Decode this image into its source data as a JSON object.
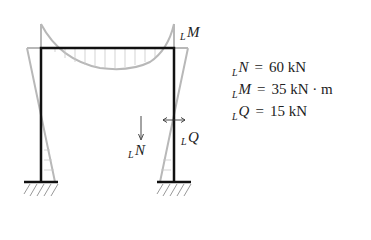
{
  "diagram": {
    "type": "portal frame bending moment diagram",
    "labels": {
      "moment": {
        "sub": "L",
        "var": "M"
      },
      "normal": {
        "sub": "L",
        "var": "N"
      },
      "shear": {
        "sub": "L",
        "var": "Q"
      }
    },
    "colors": {
      "frame": "#111111",
      "moment_diagram": "#b8b8b8",
      "hatch": "#999999",
      "arrows": "#333333"
    }
  },
  "results": [
    {
      "sub": "L",
      "var": "N",
      "eq": "=",
      "value": "60 kN"
    },
    {
      "sub": "L",
      "var": "M",
      "eq": "=",
      "value": "35 kN · m"
    },
    {
      "sub": "L",
      "var": "Q",
      "eq": "=",
      "value": "15 kN"
    }
  ]
}
